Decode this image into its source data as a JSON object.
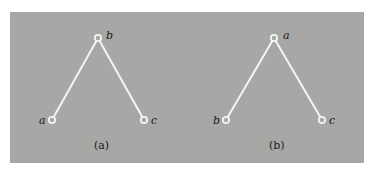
{
  "figure": {
    "background_color": "#a7a7a5",
    "edge_color": "#f4f4f2",
    "diagrams": [
      {
        "caption": "(a)",
        "nodes": {
          "top": {
            "label": "b",
            "x": 98,
            "y": 38
          },
          "left": {
            "label": "a",
            "x": 52,
            "y": 120
          },
          "right": {
            "label": "c",
            "x": 144,
            "y": 120
          }
        },
        "edges": [
          [
            "b",
            "a"
          ],
          [
            "b",
            "c"
          ]
        ]
      },
      {
        "caption": "(b)",
        "nodes": {
          "top": {
            "label": "a",
            "x": 274,
            "y": 38
          },
          "left": {
            "label": "b",
            "x": 226,
            "y": 120
          },
          "right": {
            "label": "c",
            "x": 322,
            "y": 120
          }
        },
        "edges": [
          [
            "a",
            "b"
          ],
          [
            "a",
            "c"
          ]
        ]
      }
    ]
  }
}
